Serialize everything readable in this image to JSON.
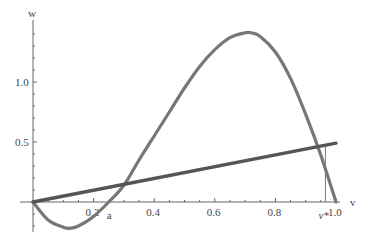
{
  "chart_data": {
    "type": "line",
    "title": "",
    "xlabel": "v",
    "ylabel": "w",
    "xlim": [
      0,
      1.0
    ],
    "ylim": [
      -0.25,
      1.45
    ],
    "grid": false,
    "x_ticks": [
      "0.2",
      "0.4",
      "0.6",
      "0.8",
      "1.0"
    ],
    "y_ticks": [
      "0.5",
      "1.0"
    ],
    "annotations": [
      {
        "text": "a",
        "x": 0.25,
        "y": 0
      },
      {
        "text": "v*",
        "x": 0.965,
        "y": 0
      }
    ],
    "series": [
      {
        "name": "cubic nullcline",
        "color": "#777777",
        "x": [
          0,
          0.05,
          0.1,
          0.12,
          0.15,
          0.2,
          0.25,
          0.3,
          0.35,
          0.4,
          0.45,
          0.5,
          0.55,
          0.6,
          0.65,
          0.7,
          0.72,
          0.75,
          0.8,
          0.85,
          0.9,
          0.95,
          1.0
        ],
        "values": [
          0,
          -0.15,
          -0.21,
          -0.22,
          -0.2,
          -0.12,
          0,
          0.14,
          0.35,
          0.55,
          0.75,
          0.95,
          1.13,
          1.27,
          1.37,
          1.41,
          1.41,
          1.38,
          1.25,
          1.03,
          0.73,
          0.39,
          0
        ]
      },
      {
        "name": "linear nullcline",
        "color": "#555555",
        "x": [
          0,
          1.0
        ],
        "values": [
          0,
          0.49
        ]
      }
    ]
  }
}
